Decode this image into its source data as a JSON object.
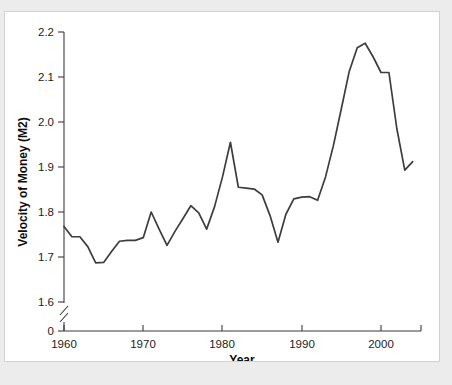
{
  "chart_data": {
    "type": "line",
    "title": "",
    "xlabel": "Year",
    "ylabel": "Velocity of Money (M2)",
    "xlim": [
      1960,
      2005
    ],
    "ylim": [
      1.555,
      2.2
    ],
    "grid": false,
    "legend": null,
    "y_axis_break": true,
    "y_break_label": "0",
    "xticks": [
      1960,
      1970,
      1980,
      1990,
      2000
    ],
    "xtick_labels": [
      "1960",
      "1970",
      "1980",
      "1990",
      "2000"
    ],
    "yticks": [
      1.6,
      1.7,
      1.8,
      1.9,
      2.0,
      2.1,
      2.2
    ],
    "ytick_labels": [
      "1.6",
      "1.7",
      "1.8",
      "1.9",
      "2.0",
      "2.1",
      "2.2"
    ],
    "line_color": "#3d3d3d",
    "series": [
      {
        "name": "Velocity of Money (M2)",
        "x": [
          1960,
          1961,
          1962,
          1963,
          1964,
          1965,
          1966,
          1967,
          1968,
          1969,
          1970,
          1971,
          1972,
          1973,
          1974,
          1975,
          1976,
          1977,
          1978,
          1979,
          1980,
          1981,
          1982,
          1983,
          1984,
          1985,
          1986,
          1987,
          1988,
          1989,
          1990,
          1991,
          1992,
          1993,
          1994,
          1995,
          1996,
          1997,
          1998,
          1999,
          2000,
          2001,
          2002,
          2003,
          2004
        ],
        "values": [
          1.768,
          1.745,
          1.745,
          1.723,
          1.687,
          1.688,
          1.712,
          1.735,
          1.737,
          1.737,
          1.743,
          1.8,
          1.762,
          1.726,
          1.757,
          1.785,
          1.814,
          1.798,
          1.762,
          1.812,
          1.878,
          1.955,
          1.855,
          1.853,
          1.851,
          1.838,
          1.792,
          1.733,
          1.795,
          1.829,
          1.833,
          1.834,
          1.826,
          1.878,
          1.948,
          2.03,
          2.113,
          2.165,
          2.175,
          2.145,
          2.11,
          2.11,
          1.985,
          1.893,
          1.912
        ]
      }
    ]
  },
  "axes": {
    "y_title": "Velocity of Money (M2)",
    "x_title": "Year",
    "zero_label": "0"
  }
}
